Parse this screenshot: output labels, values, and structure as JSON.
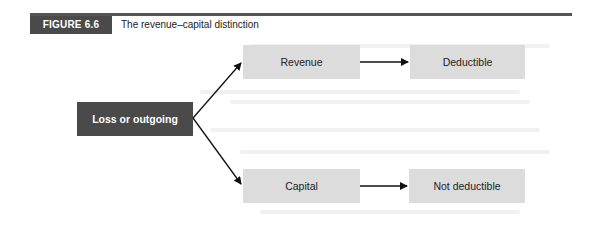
{
  "figure": {
    "label": "FIGURE 6.6",
    "title": "The revenue–capital distinction"
  },
  "nodes": {
    "source": "Loss or outgoing",
    "revenue": "Revenue",
    "capital": "Capital",
    "deductible": "Deductible",
    "not_deductible": "Not deductible"
  },
  "edges": [
    {
      "from": "Loss or outgoing",
      "to": "Revenue"
    },
    {
      "from": "Loss or outgoing",
      "to": "Capital"
    },
    {
      "from": "Revenue",
      "to": "Deductible"
    },
    {
      "from": "Capital",
      "to": "Not deductible"
    }
  ],
  "colors": {
    "header_bar": "#4a4a4a",
    "source_box": "#4a4a4a",
    "category_box": "#dcdcdc",
    "arrow": "#111111"
  }
}
